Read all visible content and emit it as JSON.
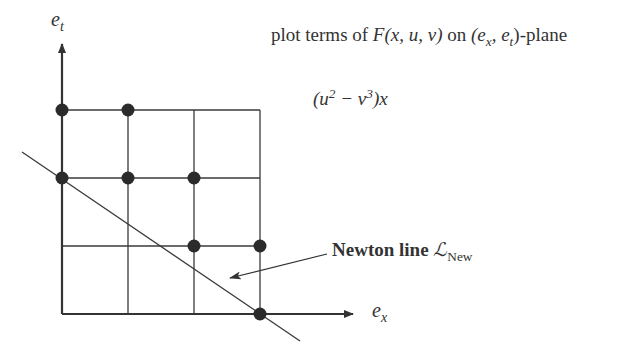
{
  "diagram": {
    "title": {
      "prefix": "plot terms of ",
      "func": "F",
      "args": "(x, u, v)",
      "mid": " on ",
      "plane": "(e",
      "plane_sub1": "x",
      "plane_sep": ", e",
      "plane_sub2": "t",
      "suffix": ")-plane"
    },
    "expression": {
      "open": "(u",
      "sup1": "2",
      "minus": " − v",
      "sup2": "3",
      "close": ")x"
    },
    "axes": {
      "y_label": "e",
      "y_sub": "t",
      "x_label": "e",
      "x_sub": "x"
    },
    "newton_label": {
      "bold": "Newton line",
      "symbol": "ℒ",
      "sub": "New"
    },
    "grid": {
      "columns": 4,
      "rows": 3
    },
    "points": [
      {
        "ex": 0,
        "et": 3
      },
      {
        "ex": 1,
        "et": 3
      },
      {
        "ex": 0,
        "et": 2
      },
      {
        "ex": 1,
        "et": 2
      },
      {
        "ex": 2,
        "et": 2
      },
      {
        "ex": 2,
        "et": 1
      },
      {
        "ex": 3,
        "et": 1
      },
      {
        "ex": 3,
        "et": 0
      }
    ],
    "newton_line": {
      "from": [
        22,
        152
      ],
      "to": [
        300,
        341
      ]
    },
    "colors": {
      "stroke": "#333333",
      "dot": "#2b2b2b"
    }
  }
}
